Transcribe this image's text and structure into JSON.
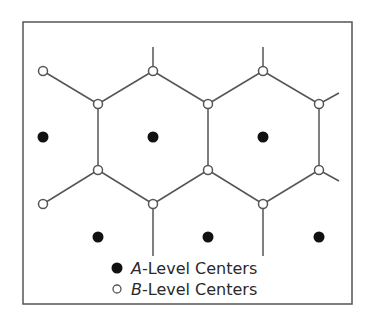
{
  "diagram": {
    "type": "central-place hexagonal lattice",
    "frame": {
      "x": 23,
      "y": 22,
      "width": 329,
      "height": 282
    },
    "colors": {
      "line": "#555555",
      "frame": "#555555",
      "a_fill": "#111111",
      "b_fill": "#ffffff"
    },
    "a_centers": [
      {
        "x": 43,
        "y": 137
      },
      {
        "x": 153,
        "y": 137
      },
      {
        "x": 263,
        "y": 137
      },
      {
        "x": 98,
        "y": 237
      },
      {
        "x": 208,
        "y": 237
      },
      {
        "x": 319,
        "y": 237
      }
    ],
    "b_centers": [
      {
        "x": 43,
        "y": 71
      },
      {
        "x": 153,
        "y": 71
      },
      {
        "x": 263,
        "y": 71
      },
      {
        "x": 98,
        "y": 104
      },
      {
        "x": 208,
        "y": 104
      },
      {
        "x": 319,
        "y": 104
      },
      {
        "x": 98,
        "y": 170
      },
      {
        "x": 208,
        "y": 170
      },
      {
        "x": 319,
        "y": 170
      },
      {
        "x": 43,
        "y": 204
      },
      {
        "x": 153,
        "y": 204
      },
      {
        "x": 263,
        "y": 204
      }
    ]
  },
  "legend": {
    "a_prefix": "A",
    "a_suffix": "-Level Centers",
    "b_prefix": "B",
    "b_suffix": "-Level Centers"
  }
}
